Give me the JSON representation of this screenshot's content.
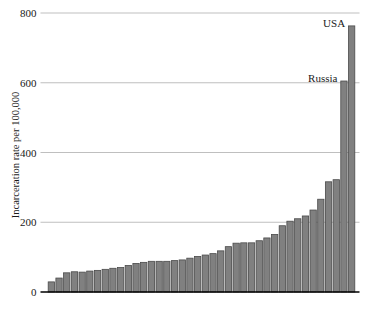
{
  "chart_data": {
    "type": "bar",
    "title": "",
    "subtitle": "",
    "xlabel": "",
    "ylabel": "Incarceration rate per 100,000",
    "ylim": [
      0,
      800
    ],
    "yticks": [
      0,
      200,
      400,
      600,
      800
    ],
    "ytick_labels": [
      "0",
      "200",
      "400",
      "600",
      "800"
    ],
    "grid": "horizontal",
    "legend": "none",
    "bar_color": "#808080",
    "bar_edge_color": "#4a4a4a",
    "axis_color": "#000000",
    "gridline_color": "#b8b8b8",
    "background": "#ffffff",
    "categories": [
      "b1",
      "b2",
      "b3",
      "b4",
      "b5",
      "b6",
      "b7",
      "b8",
      "b9",
      "b10",
      "b11",
      "b12",
      "b13",
      "b14",
      "b15",
      "b16",
      "b17",
      "b18",
      "b19",
      "b20",
      "b21",
      "b22",
      "b23",
      "b24",
      "b25",
      "b26",
      "b27",
      "b28",
      "b29",
      "b30",
      "b31",
      "b32",
      "b33",
      "b34",
      "b35",
      "b36",
      "b37",
      "b38"
    ],
    "values": [
      29,
      40,
      55,
      58,
      57,
      60,
      62,
      65,
      68,
      70,
      76,
      82,
      85,
      88,
      88,
      88,
      90,
      92,
      97,
      102,
      106,
      110,
      118,
      130,
      140,
      141,
      141,
      147,
      155,
      165,
      190,
      203,
      210,
      218,
      235,
      266,
      316,
      322
    ],
    "extra_bars": [
      {
        "name": "Russia",
        "value": 605,
        "label": "Russia"
      },
      {
        "name": "USA",
        "value": 763,
        "label": "USA"
      }
    ],
    "annotations": [
      {
        "text": "USA",
        "value": 763
      },
      {
        "text": "Russia",
        "value": 605
      }
    ]
  },
  "axis": {
    "y_axis_title": "Incarceration rate per 100,000"
  }
}
